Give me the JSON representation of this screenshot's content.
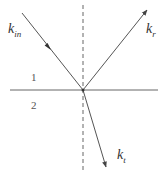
{
  "diagram": {
    "type": "wave-reflection-refraction",
    "interface": {
      "x1": 10,
      "x2": 158,
      "y": 90
    },
    "normal": {
      "x": 83,
      "y1": 5,
      "y2": 172,
      "style": "dashed"
    },
    "incidence_point": {
      "x": 83,
      "y": 90
    },
    "rays": [
      {
        "name": "incident",
        "label_main": "k",
        "label_sub": "in",
        "from": [
          22,
          13
        ],
        "to": [
          83,
          90
        ],
        "arrow_at": [
          51,
          50
        ]
      },
      {
        "name": "reflected",
        "label_main": "k",
        "label_sub": "r",
        "from": [
          83,
          90
        ],
        "to": [
          147,
          10
        ],
        "arrow_at": [
          147,
          10
        ]
      },
      {
        "name": "transmitted",
        "label_main": "k",
        "label_sub": "t",
        "from": [
          83,
          90
        ],
        "to": [
          106,
          167
        ],
        "arrow_at": [
          106,
          167
        ]
      }
    ],
    "regions": [
      {
        "label": "1"
      },
      {
        "label": "2"
      }
    ],
    "colors": {
      "line": "#555555",
      "text": "#333333"
    }
  }
}
